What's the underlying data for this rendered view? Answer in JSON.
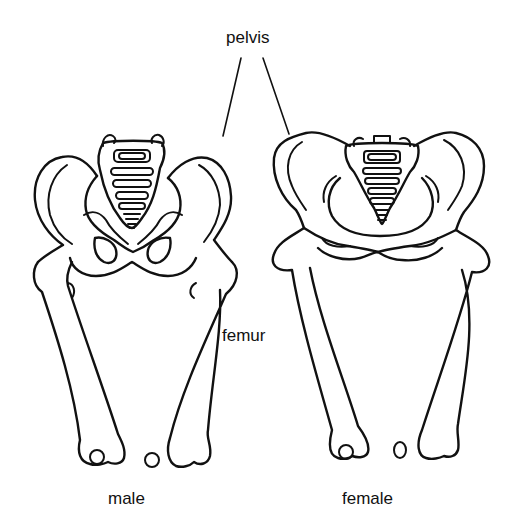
{
  "diagram": {
    "labels": {
      "pelvis": "pelvis",
      "femur": "femur",
      "male": "male",
      "female": "female"
    },
    "figures": [
      {
        "id": "male",
        "caption": "male",
        "pelvis_shape": "narrow, tall, heart-shaped inlet",
        "femur_angle": "steeper"
      },
      {
        "id": "female",
        "caption": "female",
        "pelvis_shape": "wide, shallow, round inlet",
        "femur_angle": "more oblique"
      }
    ],
    "leader_lines": [
      {
        "from": "pelvis",
        "to": "male-pelvis"
      },
      {
        "from": "pelvis",
        "to": "female-pelvis"
      }
    ],
    "colors": {
      "line": "#111111",
      "background": "#ffffff"
    }
  }
}
